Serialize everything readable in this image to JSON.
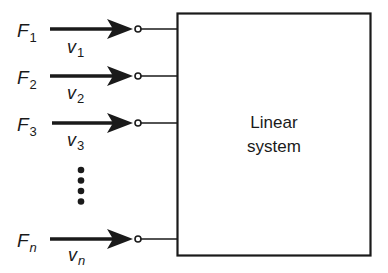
{
  "diagram": {
    "title": "",
    "system_block": {
      "label_line1": "Linear",
      "label_line2": "system"
    },
    "inputs": [
      {
        "force": "F",
        "force_sub": "1",
        "velocity": "v",
        "velocity_sub": "1"
      },
      {
        "force": "F",
        "force_sub": "2",
        "velocity": "v",
        "velocity_sub": "2"
      },
      {
        "force": "F",
        "force_sub": "3",
        "velocity": "v",
        "velocity_sub": "3"
      },
      {
        "force": "F",
        "force_sub": "n",
        "velocity": "v",
        "velocity_sub": "n"
      }
    ],
    "ellipsis": "vertical-dots",
    "colors": {
      "stroke": "#1a1a1a",
      "background": "#ffffff"
    }
  }
}
